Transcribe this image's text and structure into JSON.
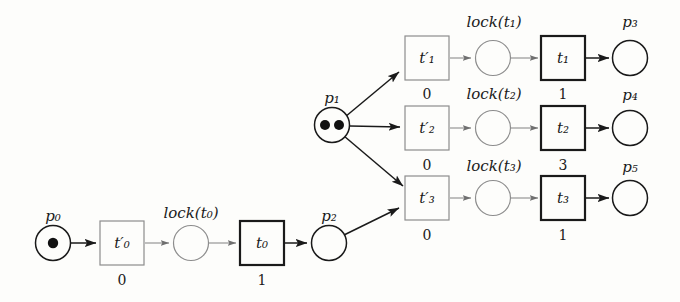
{
  "diagram": {
    "type": "petri-net",
    "title": "",
    "background_color": "#fdfdfb",
    "ink_color": "#1a1a1a",
    "light_ink_color": "#8a8a8a",
    "places": [
      {
        "id": "p0",
        "label": "p",
        "sub": "0",
        "tokens": 1,
        "x": 53,
        "y": 243,
        "r": 17,
        "style": "dark"
      },
      {
        "id": "lock_t0",
        "label": "lock(t",
        "sub": "0",
        "label_tail": ")",
        "tokens": 0,
        "x": 191,
        "y": 243,
        "r": 17,
        "style": "light"
      },
      {
        "id": "p2",
        "label": "p",
        "sub": "2",
        "tokens": 0,
        "x": 329,
        "y": 243,
        "r": 17,
        "style": "dark"
      },
      {
        "id": "p1",
        "label": "p",
        "sub": "1",
        "tokens": 2,
        "x": 332,
        "y": 125,
        "r": 17,
        "style": "dark"
      },
      {
        "id": "lock_t1",
        "label": "lock(t",
        "sub": "1",
        "label_tail": ")",
        "tokens": 0,
        "x": 493,
        "y": 58,
        "r": 17,
        "style": "light"
      },
      {
        "id": "p3",
        "label": "p",
        "sub": "3",
        "tokens": 0,
        "x": 630,
        "y": 58,
        "r": 17,
        "style": "dark"
      },
      {
        "id": "lock_t2",
        "label": "lock(t",
        "sub": "2",
        "label_tail": ")",
        "tokens": 0,
        "x": 493,
        "y": 128,
        "r": 17,
        "style": "light"
      },
      {
        "id": "p4",
        "label": "p",
        "sub": "4",
        "tokens": 0,
        "x": 630,
        "y": 128,
        "r": 17,
        "style": "dark"
      },
      {
        "id": "lock_t3",
        "label": "lock(t",
        "sub": "3",
        "label_tail": ")",
        "tokens": 0,
        "x": 493,
        "y": 198,
        "r": 17,
        "style": "light"
      },
      {
        "id": "p5",
        "label": "p",
        "sub": "5",
        "tokens": 0,
        "x": 630,
        "y": 198,
        "r": 17,
        "style": "dark"
      }
    ],
    "transitions": [
      {
        "id": "t0p",
        "label": "t",
        "sub": "0",
        "primed": true,
        "weight": "0",
        "x": 122,
        "y": 243,
        "w": 44,
        "h": 44,
        "style": "light"
      },
      {
        "id": "t0",
        "label": "t",
        "sub": "0",
        "primed": false,
        "weight": "1",
        "x": 262,
        "y": 243,
        "w": 44,
        "h": 44,
        "style": "bold"
      },
      {
        "id": "t1p",
        "label": "t",
        "sub": "1",
        "primed": true,
        "weight": "0",
        "x": 427,
        "y": 58,
        "w": 44,
        "h": 44,
        "style": "light"
      },
      {
        "id": "t1",
        "label": "t",
        "sub": "1",
        "primed": false,
        "weight": "1",
        "x": 563,
        "y": 58,
        "w": 44,
        "h": 44,
        "style": "bold"
      },
      {
        "id": "t2p",
        "label": "t",
        "sub": "2",
        "primed": true,
        "weight": "0",
        "x": 427,
        "y": 128,
        "w": 44,
        "h": 44,
        "style": "light"
      },
      {
        "id": "t2",
        "label": "t",
        "sub": "2",
        "primed": false,
        "weight": "3",
        "x": 563,
        "y": 128,
        "w": 44,
        "h": 44,
        "style": "bold"
      },
      {
        "id": "t3p",
        "label": "t",
        "sub": "3",
        "primed": true,
        "weight": "0",
        "x": 427,
        "y": 198,
        "w": 44,
        "h": 44,
        "style": "light"
      },
      {
        "id": "t3",
        "label": "t",
        "sub": "3",
        "primed": false,
        "weight": "1",
        "x": 563,
        "y": 198,
        "w": 44,
        "h": 44,
        "style": "bold"
      }
    ],
    "arcs": [
      {
        "from": "p0",
        "to": "t0p",
        "style": "dark"
      },
      {
        "from": "t0p",
        "to": "lock_t0",
        "style": "light"
      },
      {
        "from": "lock_t0",
        "to": "t0",
        "style": "light"
      },
      {
        "from": "t0",
        "to": "p2",
        "style": "dark"
      },
      {
        "from": "p2",
        "to": "t3p",
        "style": "dark"
      },
      {
        "from": "p1",
        "to": "t1p",
        "style": "dark"
      },
      {
        "from": "p1",
        "to": "t2p",
        "style": "dark"
      },
      {
        "from": "p1",
        "to": "t3p",
        "style": "dark"
      },
      {
        "from": "t1p",
        "to": "lock_t1",
        "style": "light"
      },
      {
        "from": "lock_t1",
        "to": "t1",
        "style": "light"
      },
      {
        "from": "t1",
        "to": "p3",
        "style": "dark"
      },
      {
        "from": "t2p",
        "to": "lock_t2",
        "style": "light"
      },
      {
        "from": "lock_t2",
        "to": "t2",
        "style": "light"
      },
      {
        "from": "t2",
        "to": "p4",
        "style": "dark"
      },
      {
        "from": "t3p",
        "to": "lock_t3",
        "style": "light"
      },
      {
        "from": "lock_t3",
        "to": "t3",
        "style": "light"
      },
      {
        "from": "t3",
        "to": "p5",
        "style": "dark"
      }
    ],
    "labels": {
      "p0": "p₀",
      "p1": "p₁",
      "p2": "p₂",
      "p3": "p₃",
      "p4": "p₄",
      "p5": "p₅",
      "lock_t0": "lock(t₀)",
      "lock_t1": "lock(t₁)",
      "lock_t2": "lock(t₂)",
      "lock_t3": "lock(t₃)",
      "t0p": "t′₀",
      "t0": "t₀",
      "t1p": "t′₁",
      "t1": "t₁",
      "t2p": "t′₂",
      "t2": "t₂",
      "t3p": "t′₃",
      "t3": "t₃",
      "w_t0p": "0",
      "w_t0": "1",
      "w_t1p": "0",
      "w_t1": "1",
      "w_t2p": "0",
      "w_t2": "3",
      "w_t3p": "0",
      "w_t3": "1"
    }
  }
}
